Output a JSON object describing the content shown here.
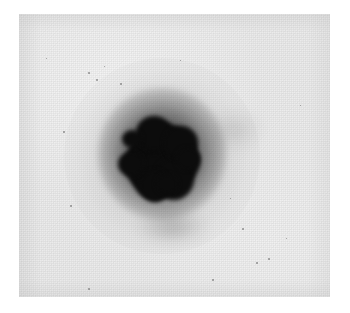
{
  "image": {
    "kind": "grayscale-photographic-plate",
    "description": "Grainy black-and-white plate scan showing a single dense dark spot with a diffuse halo on a light mottled background",
    "canvas": {
      "width": 350,
      "height": 313,
      "background_color": "#ffffff"
    },
    "plate": {
      "x": 19,
      "y": 14,
      "width": 311,
      "height": 283,
      "background_color": "#eeeeee",
      "grain": "halftone",
      "border": "none"
    },
    "spot": {
      "label": "central dark spot",
      "center_x": 162,
      "center_y": 156,
      "core_width": 70,
      "core_height": 72,
      "core_color": "#0c0c0c",
      "halo_radius": 98,
      "halo_color": "#8a8a8a",
      "shape": "irregular lobed disc"
    },
    "specks": [
      {
        "x": 88,
        "y": 72,
        "size": 2
      },
      {
        "x": 96,
        "y": 79,
        "size": 2
      },
      {
        "x": 120,
        "y": 83,
        "size": 2
      },
      {
        "x": 104,
        "y": 66,
        "size": 1
      },
      {
        "x": 63,
        "y": 131,
        "size": 2
      },
      {
        "x": 70,
        "y": 205,
        "size": 2
      },
      {
        "x": 242,
        "y": 228,
        "size": 2
      },
      {
        "x": 256,
        "y": 262,
        "size": 2
      },
      {
        "x": 268,
        "y": 258,
        "size": 2
      },
      {
        "x": 286,
        "y": 238,
        "size": 1
      },
      {
        "x": 212,
        "y": 279,
        "size": 2
      },
      {
        "x": 88,
        "y": 288,
        "size": 2
      },
      {
        "x": 300,
        "y": 105,
        "size": 1
      },
      {
        "x": 46,
        "y": 58,
        "size": 1
      },
      {
        "x": 180,
        "y": 60,
        "size": 1
      },
      {
        "x": 230,
        "y": 198,
        "size": 1
      }
    ]
  }
}
